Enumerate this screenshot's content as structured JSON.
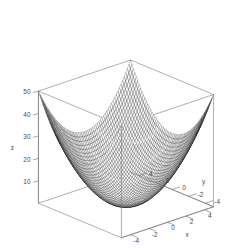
{
  "figure": {
    "name": "3d-surface-plot",
    "background_color": "#ffffff",
    "width": 249,
    "height": 248
  },
  "chart_data": {
    "type": "surface",
    "title": "",
    "subtitle": "",
    "xlabel": "x",
    "ylabel": "y",
    "zlabel": "z",
    "function": "z = x^2 + y^2",
    "grid": false,
    "legend": "none",
    "xlim": [
      -5,
      5
    ],
    "ylim": [
      -5,
      5
    ],
    "zlim": [
      0,
      50
    ],
    "xticks": [
      -4,
      -2,
      0,
      2,
      4
    ],
    "xtick_labels": [
      "-4",
      "-2",
      "0",
      "2",
      "4"
    ],
    "yticks": [
      -4,
      -2,
      0,
      2,
      4
    ],
    "ytick_labels": [
      "-4",
      "-2",
      "0",
      "2",
      "4"
    ],
    "zticks": [
      10,
      20,
      30,
      40,
      50
    ],
    "ztick_labels": [
      "10",
      "20",
      "30",
      "40",
      "50"
    ],
    "mesh_steps": 58,
    "surface_line_color": "#2b2b2b",
    "box_line_color": "#7a7a7a",
    "view": {
      "theta": 42,
      "phi": 22,
      "scale_x": 12.4,
      "scale_y": 12.4,
      "scale_z": 2.42,
      "origin_x": 126,
      "origin_y": 205
    },
    "x": [
      -5,
      -4.828,
      -4.655,
      -4.483,
      -4.31,
      -4.138,
      -3.966,
      -3.793,
      -3.621,
      -3.448,
      -3.276,
      -3.103,
      -2.931,
      -2.759,
      -2.586,
      -2.414,
      -2.241,
      -2.069,
      -1.897,
      -1.724,
      -1.552,
      -1.379,
      -1.207,
      -1.034,
      -0.862,
      -0.69,
      -0.517,
      -0.345,
      -0.172,
      0,
      0.172,
      0.345,
      0.517,
      0.69,
      0.862,
      1.034,
      1.207,
      1.379,
      1.552,
      1.724,
      1.897,
      2.069,
      2.241,
      2.414,
      2.586,
      2.759,
      2.931,
      3.103,
      3.276,
      3.448,
      3.621,
      3.793,
      3.966,
      4.138,
      4.31,
      4.483,
      4.655,
      4.828,
      5
    ],
    "y": [
      -5,
      -4.828,
      -4.655,
      -4.483,
      -4.31,
      -4.138,
      -3.966,
      -3.793,
      -3.621,
      -3.448,
      -3.276,
      -3.103,
      -2.931,
      -2.759,
      -2.586,
      -2.414,
      -2.241,
      -2.069,
      -1.897,
      -1.724,
      -1.552,
      -1.379,
      -1.207,
      -1.034,
      -0.862,
      -0.69,
      -0.517,
      -0.345,
      -0.172,
      0,
      0.172,
      0.345,
      0.517,
      0.69,
      0.862,
      1.034,
      1.207,
      1.379,
      1.552,
      1.724,
      1.897,
      2.069,
      2.241,
      2.414,
      2.586,
      2.759,
      2.931,
      3.103,
      3.276,
      3.448,
      3.621,
      3.793,
      3.966,
      4.138,
      4.31,
      4.483,
      4.655,
      4.828,
      5
    ],
    "z_corner_values": {
      "x_-5_y_-5": 50,
      "x_-5_y_5": 50,
      "x_5_y_-5": 50,
      "x_5_y_5": 50,
      "x_0_y_0": 0
    }
  }
}
